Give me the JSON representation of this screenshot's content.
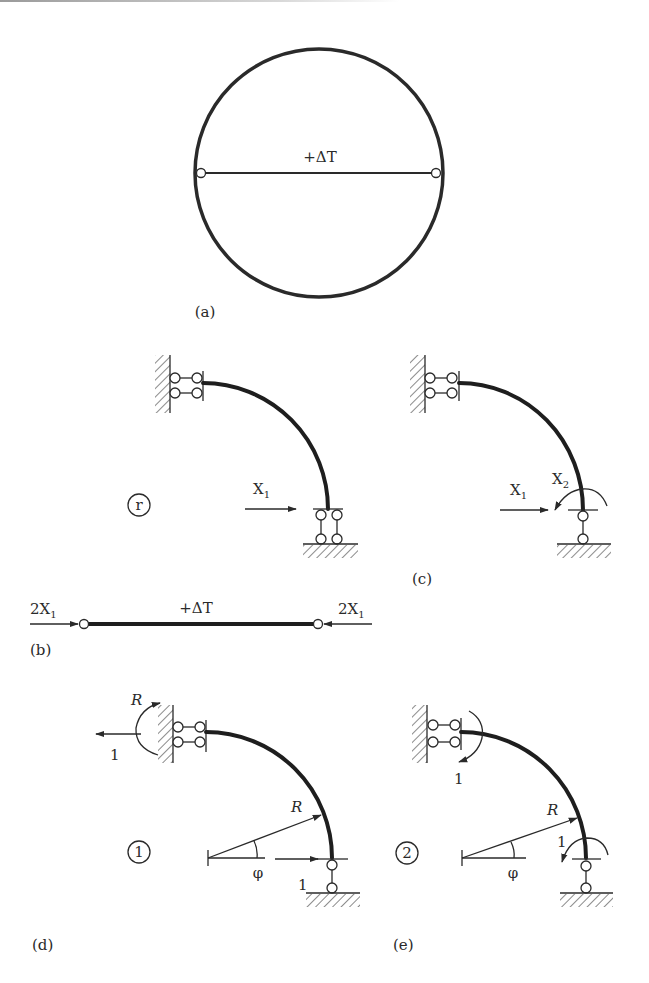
{
  "figure": {
    "panels": {
      "a": {
        "label": "(a)",
        "member_label": "+ΔT",
        "description": "circular ring with diametral bar hinged at both ends"
      },
      "r": {
        "circled_label": "r",
        "force_label": "X",
        "force_sub": "1"
      },
      "b": {
        "label": "(b)",
        "member_label": "+ΔT",
        "left_force": "2X",
        "left_force_sub": "1",
        "right_force": "2X",
        "right_force_sub": "1"
      },
      "c": {
        "label": "(c)",
        "force1_label": "X",
        "force1_sub": "1",
        "force2_label": "X",
        "force2_sub": "2"
      },
      "d": {
        "label": "(d)",
        "circled_label": "1",
        "moment_label": "R",
        "top_force_label": "1",
        "radius_label": "R",
        "angle_label": "φ",
        "bottom_force_label": "1"
      },
      "e": {
        "label": "(e)",
        "circled_label": "2",
        "top_moment_label": "1",
        "radius_label": "R",
        "angle_label": "φ",
        "bottom_moment_label": "1"
      }
    },
    "colors": {
      "ink": "#2a2a2a",
      "background": "#ffffff"
    }
  }
}
